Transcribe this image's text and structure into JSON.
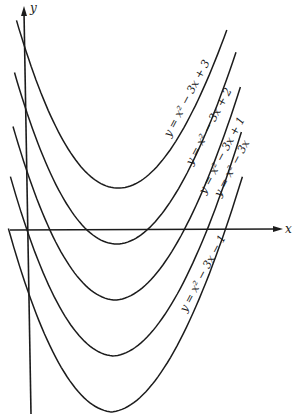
{
  "chart_data": {
    "type": "line",
    "title": "",
    "xlabel": "x",
    "ylabel": "y",
    "grid": false,
    "legend_position": "inline labels along curves",
    "series": [
      {
        "name": "y = x² − 3x + 3",
        "a": 1,
        "b": -3,
        "c": 3,
        "x_range": [
          -0.23,
          3.18
        ],
        "vertex": [
          1.5,
          0.75
        ],
        "y_intercept": 3
      },
      {
        "name": "y = x² − 3x + 2",
        "a": 1,
        "b": -3,
        "c": 2,
        "x_range": [
          -0.25,
          3.35
        ],
        "vertex": [
          1.5,
          -0.25
        ],
        "y_intercept": 2,
        "roots": [
          1,
          2
        ]
      },
      {
        "name": "y = x² − 3x + 1",
        "a": 1,
        "b": -3,
        "c": 1,
        "x_range": [
          -0.26,
          3.45
        ],
        "vertex": [
          1.5,
          -1.25
        ],
        "y_intercept": 1,
        "roots": [
          0.38,
          2.62
        ]
      },
      {
        "name": "y = x² − 3x",
        "a": 1,
        "b": -3,
        "c": 0,
        "x_range": [
          -0.29,
          3.5
        ],
        "vertex": [
          1.5,
          -2.25
        ],
        "y_intercept": 0,
        "roots": [
          0,
          3
        ]
      },
      {
        "name": "y = x² − 3x − 1",
        "a": 1,
        "b": -3,
        "c": -1,
        "x_range": [
          -0.31,
          3.55
        ],
        "vertex": [
          1.5,
          -3.25
        ],
        "y_intercept": -1,
        "roots": [
          -0.3,
          3.3
        ]
      }
    ],
    "xlim": [
      -0.35,
      4.3
    ],
    "ylim": [
      -3.3,
      4.0
    ]
  },
  "axes": {
    "x_label": "x",
    "y_label": "y"
  },
  "labels": [
    {
      "text": "y = x² − 3x + 3",
      "x": 190,
      "y": 100
    },
    {
      "text": "y = x² − 3x + 2",
      "x": 212,
      "y": 128
    },
    {
      "text": "y = x² − 3x + 1",
      "x": 225,
      "y": 157
    },
    {
      "text": "y = x² − 3x",
      "x": 235,
      "y": 170
    },
    {
      "text": "y = x² − 3x − 1",
      "x": 206,
      "y": 275
    }
  ],
  "colors": {
    "ink": "#1c1c1c",
    "paper": "#ffffff"
  }
}
